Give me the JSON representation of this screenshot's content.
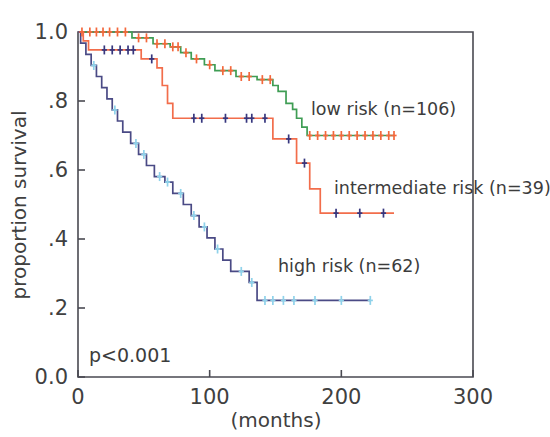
{
  "figure": {
    "name": "kaplan-meier-survival-plot",
    "p_value_text": "p<0.001",
    "xlabel": "(months)",
    "ylabel": "proportion survival"
  },
  "axes": {
    "x_ticks": [
      "0",
      "100",
      "200",
      "300"
    ],
    "x_tick_values": [
      0,
      100,
      200,
      300
    ],
    "y_ticks": [
      "0.0",
      ".2",
      ".4",
      ".6",
      ".8",
      "1.0"
    ],
    "y_tick_values": [
      0.0,
      0.2,
      0.4,
      0.6,
      0.8,
      1.0
    ]
  },
  "legend": {
    "low": "low risk (n=106)",
    "intermediate": "intermediate risk (n=39)",
    "high": "high risk (n=62)"
  },
  "colors": {
    "low_line": "#3f9d54",
    "low_censor": "#f4683c",
    "intermediate_line": "#f26d4b",
    "intermediate_censor": "#36367e",
    "high_line": "#4a4a85",
    "high_censor": "#8fd2ea",
    "axis": "#4a4a52",
    "text": "#3c3c3c"
  },
  "chart_data": {
    "type": "line",
    "subtype": "kaplan-meier-step",
    "title": "",
    "xlabel": "(months)",
    "ylabel": "proportion survival",
    "xlim": [
      0,
      300
    ],
    "ylim": [
      0.0,
      1.0
    ],
    "grid": false,
    "legend_position": "inline-annotations",
    "annotations": [
      {
        "text": "p<0.001",
        "x": 8,
        "y": 0.09
      },
      {
        "text": "low risk (n=106)",
        "x": 178,
        "y": 0.745
      },
      {
        "text": "intermediate risk (n=39)",
        "x": 196,
        "y": 0.535
      },
      {
        "text": "high risk (n=62)",
        "x": 152,
        "y": 0.305
      }
    ],
    "series": [
      {
        "name": "low risk (n=106)",
        "n": 106,
        "color": "#3f9d54",
        "censor_color": "#f4683c",
        "final_survival": 0.7,
        "steps": [
          [
            0,
            1.0
          ],
          [
            3,
            1.0
          ],
          [
            41,
            1.0
          ],
          [
            41,
            0.983
          ],
          [
            57,
            0.983
          ],
          [
            57,
            0.966
          ],
          [
            70,
            0.966
          ],
          [
            70,
            0.957
          ],
          [
            78,
            0.957
          ],
          [
            78,
            0.94
          ],
          [
            86,
            0.94
          ],
          [
            86,
            0.922
          ],
          [
            96,
            0.922
          ],
          [
            96,
            0.905
          ],
          [
            104,
            0.905
          ],
          [
            104,
            0.888
          ],
          [
            120,
            0.888
          ],
          [
            120,
            0.871
          ],
          [
            136,
            0.871
          ],
          [
            136,
            0.862
          ],
          [
            148,
            0.862
          ],
          [
            148,
            0.845
          ],
          [
            152,
            0.845
          ],
          [
            152,
            0.828
          ],
          [
            158,
            0.828
          ],
          [
            158,
            0.793
          ],
          [
            163,
            0.793
          ],
          [
            163,
            0.776
          ],
          [
            166,
            0.776
          ],
          [
            166,
            0.75
          ],
          [
            170,
            0.75
          ],
          [
            170,
            0.724
          ],
          [
            174,
            0.724
          ],
          [
            174,
            0.7
          ],
          [
            240,
            0.7
          ]
        ],
        "censor_times": [
          3,
          9,
          14,
          19,
          24,
          30,
          36,
          46,
          52,
          60,
          66,
          72,
          76,
          82,
          90,
          100,
          110,
          116,
          124,
          130,
          140,
          146,
          176,
          182,
          188,
          194,
          200,
          206,
          212,
          218,
          224,
          230,
          236,
          240
        ]
      },
      {
        "name": "intermediate risk (n=39)",
        "n": 39,
        "color": "#f26d4b",
        "censor_color": "#36367e",
        "final_survival": 0.475,
        "steps": [
          [
            0,
            1.0
          ],
          [
            4,
            1.0
          ],
          [
            4,
            0.974
          ],
          [
            8,
            0.974
          ],
          [
            8,
            0.948
          ],
          [
            48,
            0.948
          ],
          [
            48,
            0.922
          ],
          [
            60,
            0.922
          ],
          [
            60,
            0.896
          ],
          [
            64,
            0.896
          ],
          [
            64,
            0.845
          ],
          [
            68,
            0.845
          ],
          [
            68,
            0.793
          ],
          [
            72,
            0.793
          ],
          [
            72,
            0.75
          ],
          [
            148,
            0.75
          ],
          [
            148,
            0.69
          ],
          [
            166,
            0.69
          ],
          [
            166,
            0.62
          ],
          [
            176,
            0.62
          ],
          [
            176,
            0.545
          ],
          [
            184,
            0.545
          ],
          [
            184,
            0.475
          ],
          [
            240,
            0.475
          ]
        ],
        "censor_times": [
          20,
          26,
          32,
          38,
          42,
          56,
          88,
          94,
          112,
          128,
          132,
          142,
          160,
          172,
          196,
          214,
          232
        ]
      },
      {
        "name": "high risk (n=62)",
        "n": 62,
        "color": "#4a4a85",
        "censor_color": "#8fd2ea",
        "final_survival": 0.22,
        "steps": [
          [
            0,
            1.0
          ],
          [
            2,
            1.0
          ],
          [
            2,
            0.968
          ],
          [
            6,
            0.968
          ],
          [
            6,
            0.935
          ],
          [
            10,
            0.935
          ],
          [
            10,
            0.903
          ],
          [
            14,
            0.903
          ],
          [
            14,
            0.871
          ],
          [
            18,
            0.871
          ],
          [
            18,
            0.839
          ],
          [
            22,
            0.839
          ],
          [
            22,
            0.806
          ],
          [
            26,
            0.806
          ],
          [
            26,
            0.774
          ],
          [
            30,
            0.774
          ],
          [
            30,
            0.742
          ],
          [
            34,
            0.742
          ],
          [
            34,
            0.71
          ],
          [
            40,
            0.71
          ],
          [
            40,
            0.677
          ],
          [
            46,
            0.677
          ],
          [
            46,
            0.645
          ],
          [
            52,
            0.645
          ],
          [
            52,
            0.613
          ],
          [
            58,
            0.613
          ],
          [
            58,
            0.581
          ],
          [
            66,
            0.581
          ],
          [
            66,
            0.565
          ],
          [
            72,
            0.565
          ],
          [
            72,
            0.532
          ],
          [
            80,
            0.532
          ],
          [
            80,
            0.5
          ],
          [
            86,
            0.5
          ],
          [
            86,
            0.468
          ],
          [
            92,
            0.468
          ],
          [
            92,
            0.435
          ],
          [
            98,
            0.435
          ],
          [
            98,
            0.403
          ],
          [
            104,
            0.403
          ],
          [
            104,
            0.371
          ],
          [
            110,
            0.371
          ],
          [
            110,
            0.339
          ],
          [
            116,
            0.339
          ],
          [
            116,
            0.306
          ],
          [
            130,
            0.306
          ],
          [
            130,
            0.274
          ],
          [
            136,
            0.274
          ],
          [
            136,
            0.222
          ],
          [
            222,
            0.222
          ]
        ],
        "censor_times": [
          12,
          28,
          44,
          50,
          62,
          68,
          78,
          88,
          96,
          106,
          124,
          132,
          142,
          148,
          156,
          164,
          180,
          200,
          222
        ]
      }
    ]
  }
}
